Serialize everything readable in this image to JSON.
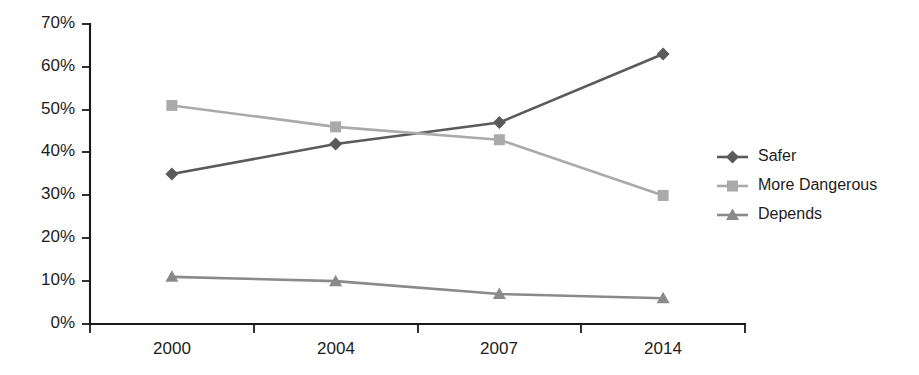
{
  "chart_data": {
    "type": "line",
    "title": "",
    "subtitle": "",
    "xlabel": "",
    "ylabel": "",
    "categories": [
      "2000",
      "2004",
      "2007",
      "2014"
    ],
    "ylim": [
      0,
      70
    ],
    "ytick_values": [
      0,
      10,
      20,
      30,
      40,
      50,
      60,
      70
    ],
    "ytick_labels": [
      "0%",
      "10%",
      "20%",
      "30%",
      "40%",
      "50%",
      "60%",
      "70%"
    ],
    "grid": false,
    "legend_position": "right",
    "series": [
      {
        "name": "Safer",
        "values": [
          35,
          42,
          47,
          63
        ],
        "color": "#5a5a5a",
        "marker": "diamond"
      },
      {
        "name": "More Dangerous",
        "values": [
          51,
          46,
          43,
          30
        ],
        "color": "#aaaaaa",
        "marker": "square"
      },
      {
        "name": "Depends",
        "values": [
          11,
          10,
          7,
          6
        ],
        "color": "#8a8a8a",
        "marker": "triangle"
      }
    ]
  },
  "legend": {
    "items": [
      {
        "label": "Safer"
      },
      {
        "label": "More Dangerous"
      },
      {
        "label": "Depends"
      }
    ]
  },
  "axes": {
    "y_tick_labels": [
      "70%",
      "60%",
      "50%",
      "40%",
      "30%",
      "20%",
      "10%",
      "0%"
    ],
    "x_tick_labels": [
      "2000",
      "2004",
      "2007",
      "2014"
    ]
  },
  "colors": {
    "axis": "#1a1a1a",
    "text": "#1d1d1d",
    "background": "#ffffff",
    "series_safer": "#5a5a5a",
    "series_more_dangerous": "#aaaaaa",
    "series_depends": "#8a8a8a"
  }
}
